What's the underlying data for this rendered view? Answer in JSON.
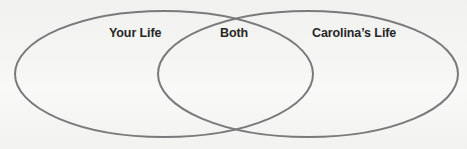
{
  "diagram": {
    "type": "venn",
    "sets": [
      {
        "id": "left",
        "label": "Your Life"
      },
      {
        "id": "right",
        "label": "Carolina’s Life"
      }
    ],
    "intersection": {
      "label": "Both"
    },
    "colors": {
      "stroke": "#7a7a7a",
      "text": "#262626",
      "background": "#f3f3f2"
    }
  }
}
